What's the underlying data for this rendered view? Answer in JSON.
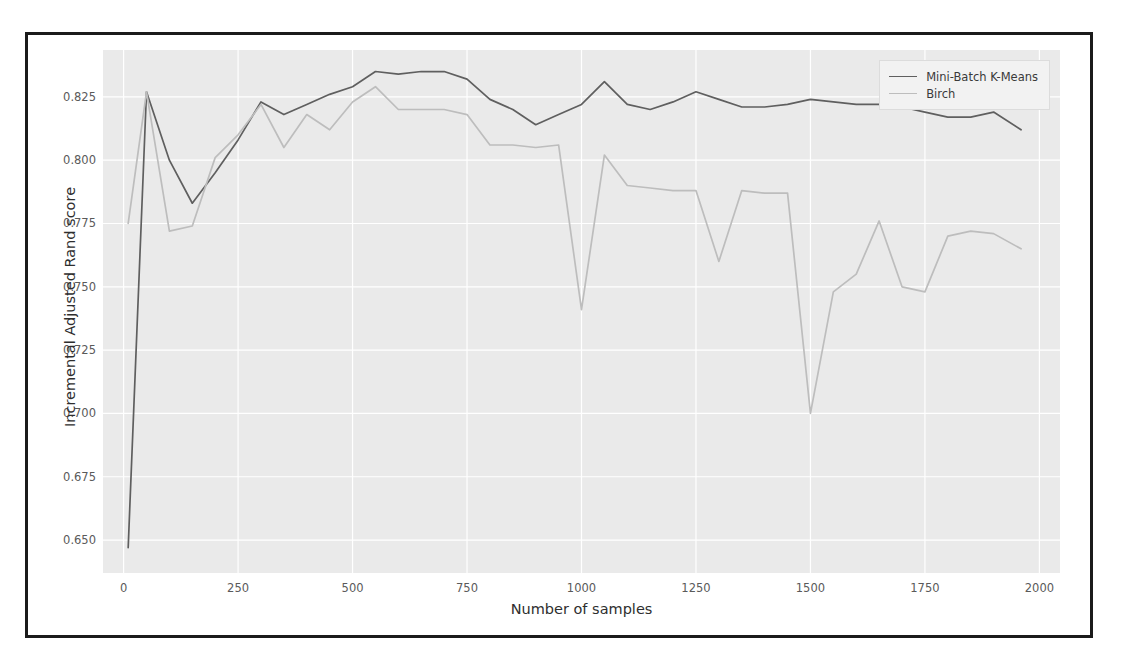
{
  "figure": {
    "panel_bg": "#eaeaea",
    "grid_color": "#ffffff",
    "frame_color": "#1b1b1b"
  },
  "axes": {
    "xlabel": "Number of samples",
    "ylabel": "Incremental Adjusted Rand score",
    "xticks": [
      0,
      250,
      500,
      750,
      1000,
      1250,
      1500,
      1750,
      2000
    ],
    "xtick_labels": [
      "0",
      "250",
      "500",
      "750",
      "1000",
      "1250",
      "1500",
      "1750",
      "2000"
    ],
    "yticks": [
      0.65,
      0.675,
      0.7,
      0.725,
      0.75,
      0.775,
      0.8,
      0.825
    ],
    "ytick_labels": [
      "0.650",
      "0.675",
      "0.700",
      "0.725",
      "0.750",
      "0.775",
      "0.800",
      "0.825"
    ]
  },
  "legend": {
    "position": "upper right",
    "entries": [
      {
        "label": "Mini-Batch K-Means",
        "color": "#5f5f5f"
      },
      {
        "label": "Birch",
        "color": "#bdbdbd"
      }
    ]
  },
  "chart_data": {
    "type": "line",
    "title": "",
    "xlabel": "Number of samples",
    "ylabel": "Incremental Adjusted Rand score",
    "xlim": [
      -45,
      2045
    ],
    "ylim": [
      0.637,
      0.8435
    ],
    "grid": true,
    "legend_position": "upper right",
    "series": [
      {
        "name": "Mini-Batch K-Means",
        "color": "#5f5f5f",
        "x": [
          10,
          50,
          100,
          150,
          200,
          250,
          300,
          350,
          400,
          450,
          500,
          550,
          600,
          650,
          700,
          750,
          800,
          850,
          900,
          950,
          1000,
          1050,
          1100,
          1150,
          1200,
          1250,
          1300,
          1350,
          1400,
          1450,
          1500,
          1550,
          1600,
          1650,
          1700,
          1750,
          1800,
          1850,
          1900,
          1960
        ],
        "y": [
          0.647,
          0.827,
          0.8,
          0.783,
          0.795,
          0.808,
          0.823,
          0.818,
          0.822,
          0.826,
          0.829,
          0.835,
          0.834,
          0.835,
          0.835,
          0.832,
          0.824,
          0.82,
          0.814,
          0.818,
          0.822,
          0.831,
          0.822,
          0.82,
          0.823,
          0.827,
          0.824,
          0.821,
          0.821,
          0.822,
          0.824,
          0.823,
          0.822,
          0.822,
          0.821,
          0.819,
          0.817,
          0.817,
          0.819,
          0.812
        ]
      },
      {
        "name": "Birch",
        "color": "#bdbdbd",
        "x": [
          10,
          50,
          100,
          150,
          200,
          250,
          300,
          350,
          400,
          450,
          500,
          550,
          600,
          650,
          700,
          750,
          800,
          850,
          900,
          950,
          1000,
          1050,
          1100,
          1150,
          1200,
          1250,
          1300,
          1350,
          1400,
          1450,
          1500,
          1550,
          1600,
          1650,
          1700,
          1750,
          1800,
          1850,
          1900,
          1960
        ],
        "y": [
          0.775,
          0.827,
          0.772,
          0.774,
          0.801,
          0.81,
          0.822,
          0.805,
          0.818,
          0.812,
          0.823,
          0.829,
          0.82,
          0.82,
          0.82,
          0.818,
          0.806,
          0.806,
          0.805,
          0.806,
          0.741,
          0.802,
          0.79,
          0.789,
          0.788,
          0.788,
          0.76,
          0.788,
          0.787,
          0.787,
          0.7,
          0.748,
          0.755,
          0.776,
          0.75,
          0.748,
          0.77,
          0.772,
          0.771,
          0.765
        ]
      }
    ]
  }
}
